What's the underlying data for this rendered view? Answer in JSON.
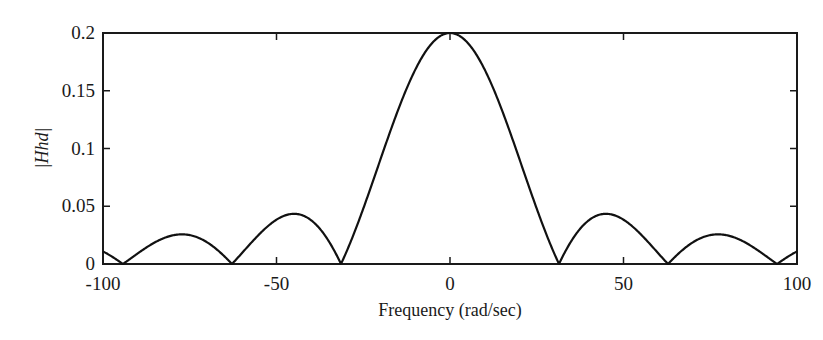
{
  "chart_data": {
    "type": "line",
    "title": "",
    "xlabel": "Frequency (rad/sec)",
    "ylabel": "|Hhd|",
    "xlim": [
      -100,
      100
    ],
    "ylim": [
      0,
      0.2
    ],
    "grid": false,
    "legend": null,
    "xticks": [
      -100,
      -50,
      0,
      50,
      100
    ],
    "xtick_labels": [
      "-100",
      "-50",
      "0",
      "50",
      "100"
    ],
    "yticks": [
      0,
      0.05,
      0.1,
      0.15,
      0.2
    ],
    "ytick_labels": [
      "0",
      "0.05",
      "0.1",
      "0.15",
      "0.2"
    ],
    "series": [
      {
        "name": "|Hhd|",
        "description": "Magnitude of sinc-shaped frequency response, 0.2*|sin(w/10)/(w/10)|",
        "x": [
          -100,
          -94.2,
          -77,
          -62.8,
          -45,
          -31.4,
          -20,
          -10,
          0,
          10,
          20,
          31.4,
          45,
          62.8,
          77,
          94.2,
          100
        ],
        "values": [
          0.011,
          0.0,
          0.025,
          0.0,
          0.043,
          0.0,
          0.091,
          0.168,
          0.2,
          0.168,
          0.091,
          0.0,
          0.043,
          0.0,
          0.025,
          0.0,
          0.011
        ]
      }
    ],
    "annotations": []
  }
}
